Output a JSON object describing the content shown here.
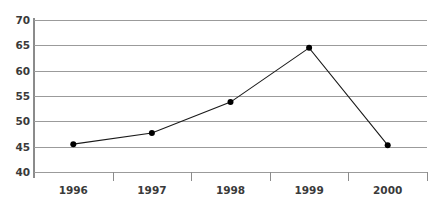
{
  "chart_data": {
    "type": "line",
    "title": "",
    "xlabel": "",
    "ylabel": "",
    "categories": [
      "1996",
      "1997",
      "1998",
      "1999",
      "2000"
    ],
    "values": [
      45.5,
      47.7,
      53.8,
      64.5,
      45.3
    ],
    "series": [
      {
        "name": "series-1",
        "values": [
          45.5,
          47.7,
          53.8,
          64.5,
          45.3
        ],
        "line_color": "#1a1a1a",
        "marker": "filled-circle",
        "marker_color": "#000000"
      }
    ],
    "ylim": [
      40,
      70
    ],
    "ytick_values": [
      70,
      65,
      60,
      55,
      50,
      45,
      40
    ],
    "ytick_labels": [
      "70",
      "65",
      "60",
      "55",
      "50",
      "45",
      "40"
    ],
    "ytick_step": 5,
    "grid": "horizontal",
    "legend": "none",
    "gridline_color": "#9b9b9b",
    "axis_color": "#8c8c8c",
    "label_color": "#3a3a3a",
    "background": "#ffffff"
  },
  "figure": {
    "cropped_top_title": ""
  }
}
